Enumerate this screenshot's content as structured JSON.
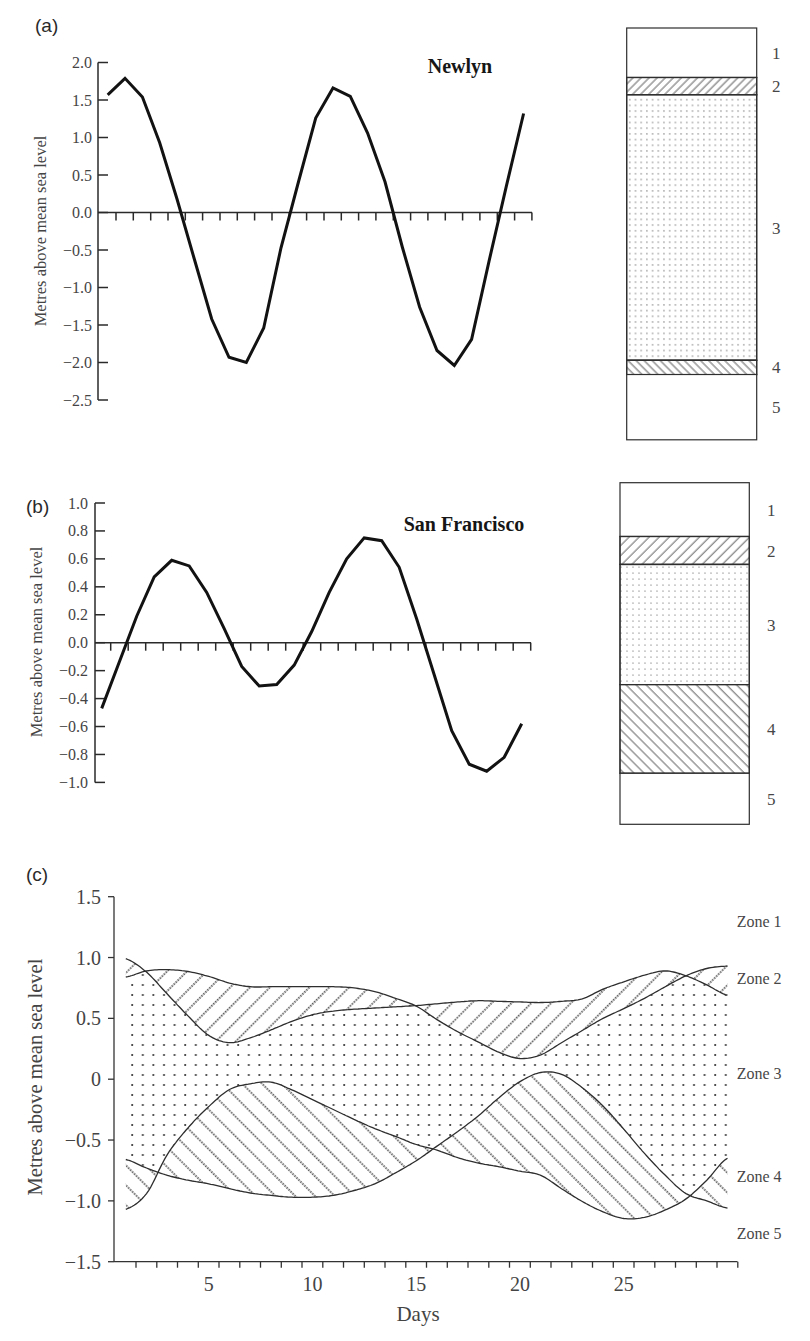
{
  "chart_data": [
    {
      "type": "line",
      "panel_label": "(a)",
      "title": "Newlyn",
      "xlabel": "",
      "ylabel": "Metres above mean sea level",
      "ylim": [
        -2.5,
        2.0
      ],
      "yticks": [
        2.0,
        1.5,
        1.0,
        0.5,
        0.0,
        -0.5,
        -1.0,
        -1.5,
        -2.0,
        -2.5
      ],
      "ytick_labels": [
        "2.0",
        "1.5",
        "1.0",
        "0.5",
        "0.0",
        "−0.5",
        "−1.0",
        "−1.5",
        "−2.0",
        "−2.5"
      ],
      "x_tick_count": 25,
      "grid": false,
      "series": [
        {
          "name": "Newlyn",
          "values": [
            1.57,
            1.79,
            1.54,
            0.93,
            0.18,
            -0.62,
            -1.42,
            -1.93,
            -2.0,
            -1.54,
            -0.47,
            0.4,
            1.26,
            1.66,
            1.55,
            1.06,
            0.41,
            -0.46,
            -1.26,
            -1.84,
            -2.04,
            -1.69,
            -0.65,
            0.35,
            1.32
          ]
        }
      ],
      "zone_column": {
        "labels": [
          "1",
          "2",
          "3",
          "4",
          "5"
        ],
        "boundaries_m": [
          2.46,
          1.8,
          1.57,
          -1.97,
          -2.16,
          -3.03
        ],
        "patterns": [
          "blank",
          "hatch-up",
          "dots",
          "hatch-down",
          "blank"
        ]
      }
    },
    {
      "type": "line",
      "panel_label": "(b)",
      "title": "San Francisco",
      "xlabel": "",
      "ylabel": "Metres above mean sea level",
      "ylim": [
        -1.0,
        1.0
      ],
      "yticks": [
        1.0,
        0.8,
        0.6,
        0.4,
        0.2,
        0.0,
        -0.2,
        -0.4,
        -0.6,
        -0.8,
        -1.0
      ],
      "ytick_labels": [
        "1.0",
        "0.8",
        "0.6",
        "0.4",
        "0.2",
        "0.0",
        "−0.2",
        "−0.4",
        "−0.6",
        "−0.8",
        "−1.0"
      ],
      "x_tick_count": 25,
      "grid": false,
      "series": [
        {
          "name": "San Francisco",
          "values": [
            -0.47,
            -0.14,
            0.19,
            0.47,
            0.59,
            0.55,
            0.36,
            0.1,
            -0.17,
            -0.31,
            -0.3,
            -0.16,
            0.08,
            0.36,
            0.6,
            0.75,
            0.73,
            0.54,
            0.17,
            -0.23,
            -0.63,
            -0.87,
            -0.92,
            -0.82,
            -0.58
          ]
        }
      ],
      "zone_column": {
        "labels": [
          "1",
          "2",
          "3",
          "4",
          "5"
        ],
        "boundaries_m": [
          1.145,
          0.76,
          0.56,
          -0.3,
          -0.935,
          -1.3
        ],
        "patterns": [
          "blank",
          "hatch-up",
          "dots",
          "hatch-down",
          "blank"
        ]
      }
    },
    {
      "type": "area",
      "panel_label": "(c)",
      "title": "",
      "xlabel": "Days",
      "ylabel": "Metres above mean sea level",
      "xlim": [
        0.4,
        30.5
      ],
      "ylim": [
        -1.5,
        1.5
      ],
      "xticks": [
        5,
        10,
        15,
        20,
        25
      ],
      "xtick_labels": [
        "5",
        "10",
        "15",
        "20",
        "25"
      ],
      "x_tick_count": 30,
      "yticks": [
        1.5,
        1.0,
        0.5,
        0,
        -0.5,
        -1.0,
        -1.5
      ],
      "ytick_labels": [
        "1.5",
        "1.0",
        "0.5",
        "0",
        "−0.5",
        "−1.0",
        "−1.5"
      ],
      "grid": false,
      "legend_position": "right",
      "x": [
        1,
        2,
        3,
        4,
        5,
        6,
        7,
        8,
        9,
        10,
        11,
        12,
        13,
        14,
        15,
        16,
        17,
        18,
        19,
        20,
        21,
        22,
        23,
        24,
        25,
        26,
        27,
        28,
        29,
        30
      ],
      "series": [
        {
          "name": "Zone 2 boundary (curve starting at 1.0)",
          "values": [
            0.99,
            0.88,
            0.7,
            0.52,
            0.36,
            0.3,
            0.34,
            0.405,
            0.475,
            0.53,
            0.56,
            0.575,
            0.585,
            0.595,
            0.605,
            0.62,
            0.635,
            0.645,
            0.64,
            0.635,
            0.63,
            0.64,
            0.66,
            0.74,
            0.8,
            0.855,
            0.89,
            0.85,
            0.775,
            0.69
          ]
        },
        {
          "name": "Zone 2 boundary (curve starting at 0.85)",
          "values": [
            0.84,
            0.89,
            0.9,
            0.885,
            0.845,
            0.79,
            0.76,
            0.76,
            0.76,
            0.76,
            0.76,
            0.75,
            0.72,
            0.665,
            0.6,
            0.49,
            0.39,
            0.305,
            0.22,
            0.17,
            0.2,
            0.3,
            0.4,
            0.5,
            0.58,
            0.665,
            0.76,
            0.85,
            0.91,
            0.93
          ]
        },
        {
          "name": "Zone 4 boundary (curve starting at -0.65)",
          "values": [
            -0.66,
            -0.73,
            -0.79,
            -0.83,
            -0.86,
            -0.9,
            -0.935,
            -0.955,
            -0.97,
            -0.97,
            -0.955,
            -0.915,
            -0.86,
            -0.77,
            -0.67,
            -0.55,
            -0.43,
            -0.3,
            -0.15,
            -0.02,
            0.055,
            0.04,
            -0.07,
            -0.22,
            -0.41,
            -0.61,
            -0.79,
            -0.94,
            -1.0,
            -1.06
          ]
        },
        {
          "name": "Zone 4 boundary (curve starting at -1.07)",
          "values": [
            -1.07,
            -0.94,
            -0.62,
            -0.4,
            -0.225,
            -0.085,
            -0.038,
            -0.024,
            -0.087,
            -0.168,
            -0.249,
            -0.33,
            -0.406,
            -0.47,
            -0.537,
            -0.583,
            -0.645,
            -0.689,
            -0.72,
            -0.756,
            -0.79,
            -0.9,
            -1.005,
            -1.09,
            -1.145,
            -1.135,
            -1.075,
            -0.984,
            -0.83,
            -0.65
          ]
        }
      ],
      "zones": [
        {
          "label": "Zone 1",
          "region": "above both upper curves",
          "pattern": "blank"
        },
        {
          "label": "Zone 2",
          "region": "between series 0 and 1",
          "pattern": "dotted-hatch-up"
        },
        {
          "label": "Zone 3",
          "region": "between lower of series 0/1 and upper of series 2/3",
          "pattern": "dots"
        },
        {
          "label": "Zone 4",
          "region": "between series 2 and 3",
          "pattern": "dotted-hatch-down"
        },
        {
          "label": "Zone 5",
          "region": "below both lower curves",
          "pattern": "blank"
        }
      ]
    }
  ]
}
